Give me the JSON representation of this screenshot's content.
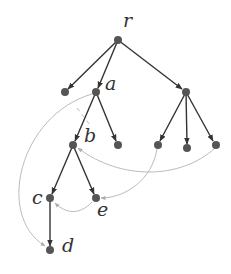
{
  "diagram": {
    "title": "",
    "colors": {
      "node": "#555555",
      "tree_edge": "#333333",
      "dashed_edge": "#bbbbbb",
      "label": "#333333"
    },
    "nodes": [
      {
        "id": "r",
        "label": "r",
        "x": 118,
        "y": 40
      },
      {
        "id": "l1",
        "label": "",
        "x": 65,
        "y": 92
      },
      {
        "id": "a",
        "label": "a",
        "x": 96,
        "y": 92
      },
      {
        "id": "n3",
        "label": "",
        "x": 186,
        "y": 92
      },
      {
        "id": "b",
        "label": "b",
        "x": 73,
        "y": 145
      },
      {
        "id": "a2",
        "label": "",
        "x": 118,
        "y": 145
      },
      {
        "id": "n3a",
        "label": "",
        "x": 158,
        "y": 145
      },
      {
        "id": "n3b",
        "label": "",
        "x": 187,
        "y": 148
      },
      {
        "id": "n3c",
        "label": "",
        "x": 216,
        "y": 145
      },
      {
        "id": "c",
        "label": "c",
        "x": 50,
        "y": 198
      },
      {
        "id": "e",
        "label": "e",
        "x": 96,
        "y": 198
      },
      {
        "id": "d",
        "label": "d",
        "x": 50,
        "y": 250
      }
    ],
    "tree_edges": [
      [
        "r",
        "l1"
      ],
      [
        "r",
        "a"
      ],
      [
        "r",
        "n3"
      ],
      [
        "a",
        "b"
      ],
      [
        "a",
        "a2"
      ],
      [
        "n3",
        "n3a"
      ],
      [
        "n3",
        "n3b"
      ],
      [
        "n3",
        "n3c"
      ],
      [
        "b",
        "c"
      ],
      [
        "b",
        "e"
      ],
      [
        "c",
        "d"
      ]
    ],
    "dashed_edges": [
      [
        "a",
        "d"
      ],
      [
        "a",
        "b"
      ],
      [
        "n3c",
        "b"
      ],
      [
        "n3a",
        "e"
      ],
      [
        "e",
        "c"
      ]
    ],
    "labels": {
      "r": "r",
      "a": "a",
      "b": "b",
      "c": "c",
      "d": "d",
      "e": "e"
    }
  }
}
